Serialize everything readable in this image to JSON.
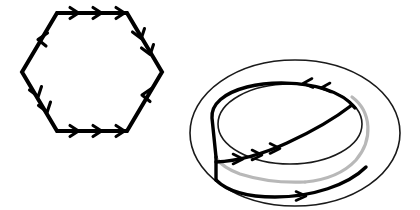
{
  "figure": {
    "title": "Hexagon with directed edge identifications and corresponding curve on a torus",
    "background_color": "#ffffff",
    "width": 420,
    "height": 210,
    "stroke_color": "#000000",
    "hidden_stroke_color": "#b8b8b8",
    "thin_stroke_color": "#1a1a1a"
  },
  "hexagon": {
    "name": "directed-hexagon",
    "center": {
      "x": 92,
      "y": 72
    },
    "vertices": [
      {
        "label": "top-left",
        "x": 57,
        "y": 13
      },
      {
        "label": "top-right",
        "x": 127,
        "y": 13
      },
      {
        "label": "right",
        "x": 162,
        "y": 72
      },
      {
        "label": "bottom-right",
        "x": 127,
        "y": 131
      },
      {
        "label": "bottom-left",
        "x": 57,
        "y": 131
      },
      {
        "label": "left",
        "x": 22,
        "y": 72
      }
    ],
    "stroke_width": 4,
    "edges": [
      {
        "id": "edge-top",
        "from": "top-left",
        "to": "top-right",
        "arrow_count": 3,
        "direction": "right"
      },
      {
        "id": "edge-upper-right",
        "from": "top-right",
        "to": "right",
        "arrow_count": 2,
        "direction": "down-right"
      },
      {
        "id": "edge-lower-right",
        "from": "right",
        "to": "bottom-right",
        "arrow_count": 1,
        "direction": "down-left"
      },
      {
        "id": "edge-bottom",
        "from": "bottom-left",
        "to": "bottom-right",
        "arrow_count": 3,
        "direction": "right"
      },
      {
        "id": "edge-lower-left",
        "from": "left",
        "to": "bottom-left",
        "arrow_count": 2,
        "direction": "down-right"
      },
      {
        "id": "edge-upper-left",
        "from": "top-left",
        "to": "left",
        "arrow_count": 1,
        "direction": "down-left"
      }
    ]
  },
  "torus": {
    "name": "torus-with-curve",
    "outer_ellipse": {
      "cx": 295,
      "cy": 133,
      "rx": 105,
      "ry": 73,
      "stroke_width": 1.6
    },
    "hole_ellipse": {
      "cx": 290,
      "cy": 124,
      "rx": 72,
      "ry": 40,
      "stroke_width": 1.6
    },
    "curve": {
      "stroke_width": 3.4,
      "visible_segments": 3,
      "hidden_segments": 2,
      "arrow_groups": [
        {
          "id": "curve-arrows-upper",
          "count": 2,
          "direction": "left",
          "location": "top-right-of-inner-ring"
        },
        {
          "id": "curve-arrows-lower",
          "count": 3,
          "direction": "right",
          "location": "bottom-left-of-inner-ring"
        },
        {
          "id": "curve-arrow-back",
          "count": 1,
          "direction": "right",
          "location": "bottom-front-of-torus"
        }
      ],
      "connector": {
        "id": "vertical-connector",
        "x": 216,
        "y_top": 157,
        "y_bottom": 180
      }
    }
  }
}
